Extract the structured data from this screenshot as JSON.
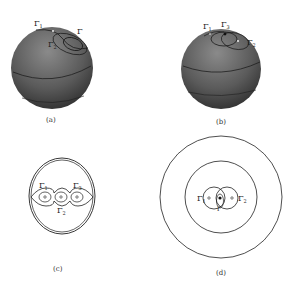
{
  "figure": {
    "panels": [
      {
        "id": "a",
        "caption": "(a)",
        "type": "sphere",
        "labels": [
          "Γ",
          "1",
          "Γ",
          "2",
          "Γ",
          "3"
        ]
      },
      {
        "id": "b",
        "caption": "(b)",
        "type": "sphere",
        "labels": [
          "Γ",
          "1",
          "Γ",
          "3",
          "Γ",
          "2"
        ]
      },
      {
        "id": "c",
        "caption": "(c)",
        "type": "planar-oval",
        "labels": [
          "Γ",
          "1",
          "Γ",
          "3",
          "Γ",
          "2"
        ]
      },
      {
        "id": "d",
        "caption": "(d)",
        "type": "concentric-circles",
        "labels": [
          "Γ",
          "1",
          "Γ",
          "2",
          "Γ",
          "3"
        ]
      }
    ],
    "colors": {
      "sphere_dark": "#3a3a3a",
      "sphere_light": "#8a8a8a",
      "line": "#222222",
      "background": "#ffffff"
    }
  }
}
